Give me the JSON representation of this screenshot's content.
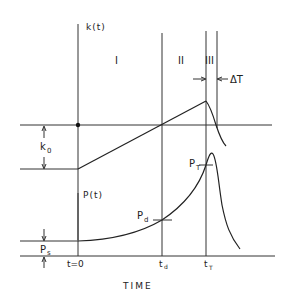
{
  "diagram": {
    "upper_axis_label": "k(t)",
    "lower_axis_label": "P(t)",
    "regions": [
      {
        "id": "region-1",
        "label": "I"
      },
      {
        "id": "region-2",
        "label": "II"
      },
      {
        "id": "region-3",
        "label": "III"
      }
    ],
    "annotations": {
      "k0": "k",
      "k0_sub": "0",
      "ps": "P",
      "ps_sub": "s",
      "pd": "P",
      "pd_sub": "d",
      "pt": "P",
      "pt_sub": "T",
      "delta_t": "ΔT"
    },
    "x_ticks": {
      "t0": "t=0",
      "td": "t",
      "td_sub": "d",
      "tT": "t",
      "tT_sub": "T"
    },
    "x_axis_label": "TIME"
  }
}
